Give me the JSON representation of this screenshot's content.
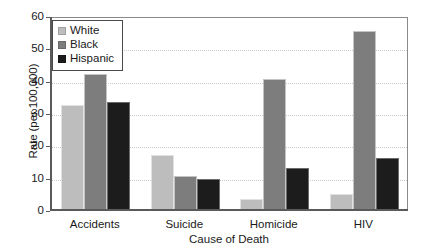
{
  "chart_data": {
    "type": "bar",
    "title": "",
    "xlabel": "Cause of Death",
    "ylabel": "Rate (per 100,000)",
    "categories": [
      "Accidents",
      "Suicide",
      "Homicide",
      "HIV"
    ],
    "series": [
      {
        "name": "White",
        "color": "#bdbdbd",
        "values": [
          32.5,
          17.0,
          3.5,
          5.0
        ]
      },
      {
        "name": "Black",
        "color": "#7d7d7d",
        "values": [
          42.0,
          10.5,
          40.5,
          55.5
        ]
      },
      {
        "name": "Hispanic",
        "color": "#1c1c1c",
        "values": [
          33.5,
          9.5,
          13.0,
          16.0
        ]
      }
    ],
    "ylim": [
      0,
      60
    ],
    "yticks": [
      0,
      10,
      20,
      30,
      40,
      50,
      60
    ],
    "ytick_labels": [
      "0",
      "10",
      "20",
      "30",
      "40",
      "50",
      "60"
    ],
    "grid": true,
    "legend_position": "top-left",
    "background": "#ffffff",
    "frame_color": "#8a8a8a"
  }
}
